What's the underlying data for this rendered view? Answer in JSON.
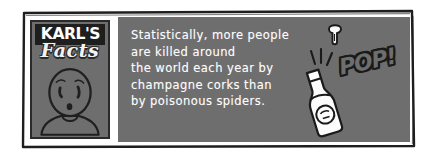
{
  "card": {
    "logo": {
      "brand_top": "KARL'S",
      "brand_bottom": "Facts",
      "avatar_icon": "worried-face-icon"
    },
    "fact": {
      "lines": [
        "Statistically, more people",
        "are killed around",
        "the world each year by",
        "champagne corks than",
        "by poisonous spiders."
      ]
    },
    "illustration": {
      "sound_effect": "POP!",
      "bottle_icon": "champagne-bottle-icon",
      "cork_icon": "flying-cork-icon",
      "burst_icon": "burst-lines-icon"
    },
    "colors": {
      "panel_gray": "#6e6e6e",
      "ink_black": "#1e1e1e",
      "paper_white": "#ffffff",
      "text_white": "#fdfdfd"
    }
  }
}
